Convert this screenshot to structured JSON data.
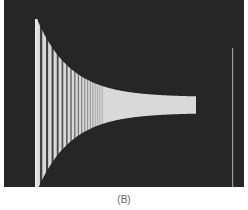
{
  "figure": {
    "caption": "(B)",
    "colors": {
      "background": "#262626",
      "trace": "#e8e8e8",
      "baseline_marker": "#9a9a9a"
    },
    "envelope": {
      "start_x": 33,
      "end_x": 192,
      "center_y": 105,
      "start_half_height": 86,
      "end_half_height": 8,
      "decay": 0.03
    },
    "first_spike": {
      "x": 33,
      "top": 19,
      "bottom": 187
    },
    "right_marker_x": 228,
    "cycle_spacing_start": 6
  }
}
